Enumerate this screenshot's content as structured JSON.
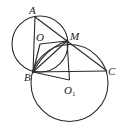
{
  "diagram": {
    "type": "geometry",
    "stroke_color": "#2a2a2a",
    "points": [
      {
        "label": "A",
        "x": 35,
        "y": 18
      },
      {
        "label": "O",
        "x": 40,
        "y": 39
      },
      {
        "label": "M",
        "x": 67,
        "y": 41
      },
      {
        "label": "B",
        "x": 33,
        "y": 72
      },
      {
        "label": "C",
        "x": 107,
        "y": 71
      },
      {
        "label": "O",
        "sub": "1",
        "x": 69,
        "y": 81
      }
    ],
    "circles": [
      {
        "name": "circle-O",
        "cx": 40,
        "cy": 44,
        "r": 28
      },
      {
        "name": "circle-O1",
        "cx": 69.5,
        "cy": 83,
        "r": 38.5
      }
    ],
    "segments": [
      "AB",
      "AC",
      "BC",
      "OM",
      "OB",
      "BM",
      "BO1",
      "MO1"
    ],
    "labels": {
      "A": "A",
      "O": "O",
      "M": "M",
      "B": "B",
      "C": "C",
      "O1": "O",
      "O1_sub": "1"
    }
  }
}
